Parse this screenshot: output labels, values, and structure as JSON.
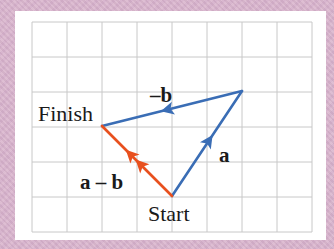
{
  "diagram": {
    "type": "vector-subtraction",
    "colors": {
      "background": "#d9b4cc",
      "panel": "#ffffff",
      "grid": "#c8c8c8",
      "vector_blue": "#3a6db5",
      "vector_orange": "#e8501e",
      "text": "#1a1a1a"
    },
    "grid": {
      "columns": 8,
      "rows": 6,
      "x0": 32,
      "y0": 22,
      "cell": 35
    },
    "points": {
      "start": {
        "label": "Start",
        "x": 172,
        "y": 196
      },
      "top": {
        "x": 242,
        "y": 91
      },
      "finish": {
        "label": "Finish",
        "x": 102,
        "y": 126
      }
    },
    "vectors": [
      {
        "name": "a",
        "label": "a",
        "from": "start",
        "to": "top",
        "color": "vector_blue"
      },
      {
        "name": "neg-b",
        "label": "–b",
        "from": "top",
        "to": "finish",
        "color": "vector_blue"
      },
      {
        "name": "a-minus-b",
        "label": "a – b",
        "from": "start",
        "to": "finish",
        "color": "vector_orange",
        "double_arrow": true
      }
    ],
    "labels": {
      "finish": "Finish",
      "start": "Start",
      "a": "a",
      "neg_b": "–b",
      "a_minus_b": "a – b"
    }
  }
}
